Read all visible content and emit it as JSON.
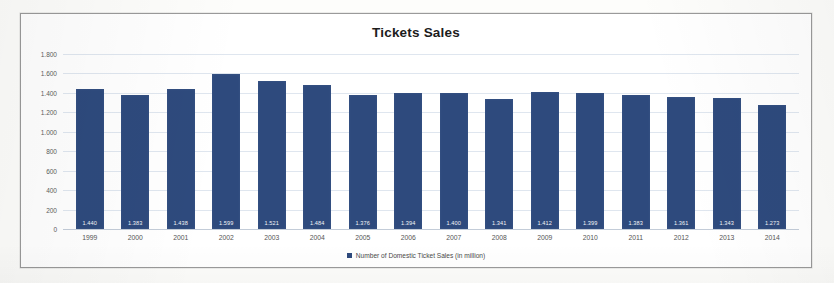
{
  "chart_data": {
    "type": "bar",
    "title": "Tickets Sales",
    "xlabel": "",
    "ylabel": "",
    "ylim": [
      0,
      1800
    ],
    "grid": true,
    "legend_position": "bottom",
    "categories": [
      "1999",
      "2000",
      "2001",
      "2002",
      "2003",
      "2004",
      "2005",
      "2006",
      "2007",
      "2008",
      "2009",
      "2010",
      "2011",
      "2012",
      "2013",
      "2014"
    ],
    "y_ticks": [
      "1.800",
      "1.600",
      "1.400",
      "1.200",
      "1.000",
      "800",
      "600",
      "400",
      "200",
      "0"
    ],
    "y_tick_values": [
      1800,
      1600,
      1400,
      1200,
      1000,
      800,
      600,
      400,
      200,
      0
    ],
    "series": [
      {
        "name": "Number of Domestic Ticket Sales (in million)",
        "color": "#2e4a7d",
        "values": [
          1440,
          1383,
          1438,
          1599,
          1521,
          1484,
          1376,
          1394,
          1400,
          1341,
          1412,
          1399,
          1383,
          1361,
          1343,
          1273
        ],
        "labels": [
          "1.440",
          "1.383",
          "1.438",
          "1.599",
          "1.521",
          "1.484",
          "1.376",
          "1.394",
          "1.400",
          "1.341",
          "1.412",
          "1.399",
          "1.383",
          "1.361",
          "1.343",
          "1.273"
        ]
      }
    ]
  },
  "legend": {
    "label": "Number of Domestic Ticket Sales (in million)"
  },
  "colors": {
    "bar": "#2e4a7d",
    "grid": "#dfe6ef",
    "frame": "#9a9a9a",
    "title": "#1c1c1c"
  }
}
